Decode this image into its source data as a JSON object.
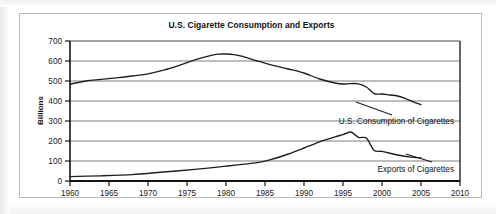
{
  "figure": {
    "title": "U.S. Cigarette Consumption and Exports"
  },
  "chart_data": {
    "type": "line",
    "title": "U.S. Cigarette Consumption and Exports",
    "xlabel": "",
    "ylabel": "Billions",
    "xlim": [
      1960,
      2010
    ],
    "ylim": [
      0,
      700
    ],
    "xticks": [
      "1960",
      "1965",
      "1970",
      "1975",
      "1980",
      "1985",
      "1990",
      "1995",
      "2000",
      "2005",
      "2010"
    ],
    "yticks": [
      "0",
      "100",
      "200",
      "300",
      "400",
      "500",
      "600",
      "700"
    ],
    "grid": "horizontal",
    "legend": "inline-annotations",
    "series": [
      {
        "name": "U.S. Consumption of Cigarettes",
        "label": "U.S. Consumption of Cigarettes",
        "x": [
          1960,
          1962,
          1964,
          1966,
          1968,
          1970,
          1972,
          1974,
          1976,
          1978,
          1979,
          1980,
          1981,
          1982,
          1984,
          1986,
          1988,
          1990,
          1992,
          1994,
          1995,
          1996,
          1997,
          1998,
          1999,
          2000,
          2001,
          2002,
          2003,
          2004,
          2005
        ],
        "values": [
          484,
          500,
          508,
          516,
          525,
          536,
          554,
          578,
          606,
          627,
          634,
          635,
          632,
          624,
          600,
          578,
          560,
          540,
          510,
          490,
          485,
          487,
          486,
          470,
          437,
          435,
          430,
          425,
          412,
          396,
          381
        ]
      },
      {
        "name": "Exports of Cigarettes",
        "label": "Exports of Cigarettes",
        "x": [
          1960,
          1964,
          1968,
          1972,
          1976,
          1980,
          1984,
          1986,
          1988,
          1990,
          1992,
          1994,
          1995,
          1996,
          1997,
          1998,
          1999,
          2000,
          2002,
          2004,
          2005
        ],
        "values": [
          22,
          26,
          32,
          45,
          58,
          74,
          92,
          110,
          135,
          165,
          196,
          221,
          232,
          245,
          218,
          215,
          152,
          148,
          130,
          118,
          115
        ]
      }
    ]
  },
  "axes": {
    "y_title": "Billions"
  }
}
